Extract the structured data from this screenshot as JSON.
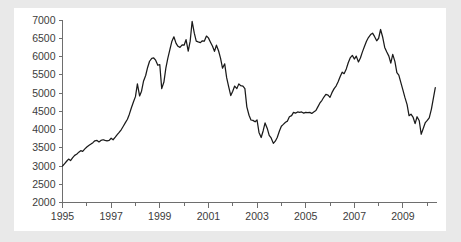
{
  "page": {
    "background_color": "#e9e9e9",
    "panel_color": "#ffffff"
  },
  "chart_data": {
    "type": "line",
    "title": "",
    "subtitle": "",
    "xlabel": "",
    "ylabel": "",
    "xlim": [
      1995.0,
      2010.4
    ],
    "ylim": [
      2000,
      7000
    ],
    "grid": false,
    "legend": "none",
    "line_color": "#1a1a1a",
    "axis_color": "#6e6e6e",
    "y_ticks": [
      2000,
      2500,
      3000,
      3500,
      4000,
      4500,
      5000,
      5500,
      6000,
      6500,
      7000
    ],
    "y_tick_labels": [
      "2000",
      "2500",
      "3000",
      "3500",
      "4000",
      "4500",
      "5000",
      "5500",
      "6000",
      "6500",
      "7000"
    ],
    "x_ticks": [
      1995,
      1996,
      1997,
      1998,
      1999,
      2000,
      2001,
      2002,
      2003,
      2004,
      2005,
      2006,
      2007,
      2008,
      2009,
      2010
    ],
    "x_tick_labels": [
      "1995",
      "",
      "1997",
      "",
      "1999",
      "",
      "2001",
      "",
      "2003",
      "",
      "2005",
      "",
      "2007",
      "",
      "2009",
      ""
    ],
    "x_major_labels": [
      "1995",
      "1997",
      "1999",
      "2001",
      "2003",
      "2005",
      "2007",
      "2009"
    ],
    "series": [
      {
        "name": "index",
        "x": [
          1995.0,
          1995.08,
          1995.17,
          1995.25,
          1995.33,
          1995.42,
          1995.5,
          1995.58,
          1995.67,
          1995.75,
          1995.83,
          1995.92,
          1996.0,
          1996.08,
          1996.17,
          1996.25,
          1996.33,
          1996.42,
          1996.5,
          1996.58,
          1996.67,
          1996.75,
          1996.83,
          1996.92,
          1997.0,
          1997.08,
          1997.17,
          1997.25,
          1997.33,
          1997.42,
          1997.5,
          1997.58,
          1997.67,
          1997.75,
          1997.83,
          1997.92,
          1998.0,
          1998.08,
          1998.17,
          1998.25,
          1998.33,
          1998.42,
          1998.5,
          1998.58,
          1998.67,
          1998.75,
          1998.83,
          1998.92,
          1999.0,
          1999.08,
          1999.17,
          1999.25,
          1999.33,
          1999.42,
          1999.5,
          1999.58,
          1999.67,
          1999.75,
          1999.83,
          1999.92,
          2000.0,
          2000.08,
          2000.17,
          2000.25,
          2000.33,
          2000.42,
          2000.5,
          2000.58,
          2000.67,
          2000.75,
          2000.83,
          2000.92,
          2001.0,
          2001.08,
          2001.17,
          2001.25,
          2001.33,
          2001.42,
          2001.5,
          2001.58,
          2001.67,
          2001.75,
          2001.83,
          2001.92,
          2002.0,
          2002.08,
          2002.17,
          2002.25,
          2002.33,
          2002.42,
          2002.5,
          2002.58,
          2002.67,
          2002.75,
          2002.83,
          2002.92,
          2003.0,
          2003.08,
          2003.17,
          2003.25,
          2003.33,
          2003.42,
          2003.5,
          2003.58,
          2003.67,
          2003.75,
          2003.83,
          2003.92,
          2004.0,
          2004.08,
          2004.17,
          2004.25,
          2004.33,
          2004.42,
          2004.5,
          2004.58,
          2004.67,
          2004.75,
          2004.83,
          2004.92,
          2005.0,
          2005.08,
          2005.17,
          2005.25,
          2005.33,
          2005.42,
          2005.5,
          2005.58,
          2005.67,
          2005.75,
          2005.83,
          2005.92,
          2006.0,
          2006.08,
          2006.17,
          2006.25,
          2006.33,
          2006.42,
          2006.5,
          2006.58,
          2006.67,
          2006.75,
          2006.83,
          2006.92,
          2007.0,
          2007.08,
          2007.17,
          2007.25,
          2007.33,
          2007.42,
          2007.5,
          2007.58,
          2007.67,
          2007.75,
          2007.83,
          2007.92,
          2008.0,
          2008.08,
          2008.17,
          2008.25,
          2008.33,
          2008.42,
          2008.5,
          2008.58,
          2008.67,
          2008.75,
          2008.83,
          2008.92,
          2009.0,
          2009.08,
          2009.17,
          2009.25,
          2009.33,
          2009.42,
          2009.5,
          2009.58,
          2009.67,
          2009.75,
          2009.83,
          2009.92,
          2010.0,
          2010.08,
          2010.17,
          2010.25,
          2010.33
        ],
        "values": [
          3000,
          3060,
          3130,
          3190,
          3150,
          3230,
          3290,
          3320,
          3380,
          3420,
          3400,
          3470,
          3520,
          3560,
          3600,
          3640,
          3690,
          3700,
          3660,
          3700,
          3720,
          3700,
          3690,
          3700,
          3760,
          3720,
          3790,
          3860,
          3920,
          4000,
          4090,
          4180,
          4280,
          4420,
          4590,
          4760,
          4900,
          5250,
          4920,
          5050,
          5320,
          5480,
          5700,
          5870,
          5950,
          5960,
          5900,
          5760,
          5780,
          5120,
          5300,
          5680,
          5950,
          6200,
          6420,
          6540,
          6360,
          6280,
          6250,
          6320,
          6310,
          6460,
          6150,
          6420,
          6960,
          6640,
          6420,
          6400,
          6380,
          6430,
          6420,
          6560,
          6510,
          6400,
          6280,
          6140,
          6310,
          6150,
          5950,
          5680,
          5800,
          5420,
          5180,
          4930,
          5050,
          5190,
          5120,
          5250,
          5200,
          5190,
          5120,
          4620,
          4390,
          4260,
          4250,
          4210,
          4260,
          3920,
          3780,
          3960,
          4180,
          4030,
          3840,
          3770,
          3620,
          3680,
          3780,
          3960,
          4090,
          4140,
          4200,
          4230,
          4350,
          4380,
          4470,
          4450,
          4480,
          4470,
          4480,
          4450,
          4470,
          4460,
          4470,
          4440,
          4480,
          4520,
          4620,
          4720,
          4800,
          4890,
          4960,
          4940,
          4880,
          5010,
          5120,
          5190,
          5300,
          5450,
          5570,
          5530,
          5660,
          5830,
          5960,
          6030,
          5930,
          6010,
          5850,
          5960,
          6120,
          6280,
          6420,
          6520,
          6600,
          6640,
          6550,
          6430,
          6500,
          6740,
          6520,
          6250,
          6130,
          6010,
          5820,
          6060,
          5860,
          5560,
          5490,
          5270,
          5080,
          4880,
          4680,
          4380,
          4420,
          4330,
          4160,
          4350,
          4240,
          3870,
          4020,
          4190,
          4250,
          4320,
          4560,
          4850,
          5150
        ]
      }
    ]
  }
}
